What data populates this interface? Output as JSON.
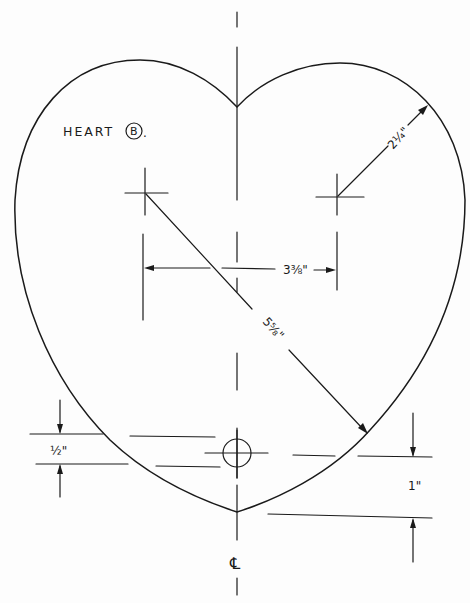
{
  "drawing": {
    "title": "HEART",
    "variant_badge": "B",
    "title_suffix": ".",
    "ink_color": "#1a1a1a",
    "paper_color": "#fdfdfd"
  },
  "dimensions": {
    "lobe_radius": "2¼\"",
    "lobe_center_spacing": "3⅜\"",
    "diagonal": "5⅝\"",
    "hole_offset": "½\"",
    "tip_offset": "1\""
  },
  "centerline_symbol": "℄"
}
